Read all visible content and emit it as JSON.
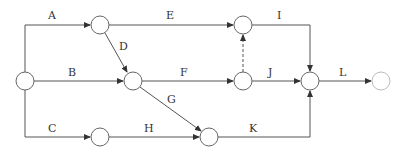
{
  "diagram": {
    "type": "activity-on-arrow network",
    "nodes": [
      {
        "id": "n1",
        "x": 25,
        "y": 81
      },
      {
        "id": "n2",
        "x": 100,
        "y": 25
      },
      {
        "id": "n3",
        "x": 133,
        "y": 81
      },
      {
        "id": "n4",
        "x": 100,
        "y": 137
      },
      {
        "id": "n5",
        "x": 209,
        "y": 137
      },
      {
        "id": "n6",
        "x": 243,
        "y": 25
      },
      {
        "id": "n7",
        "x": 243,
        "y": 81
      },
      {
        "id": "n8",
        "x": 310,
        "y": 81
      },
      {
        "id": "n9",
        "x": 381,
        "y": 81
      }
    ],
    "activities": [
      {
        "label": "A",
        "from": "n1",
        "to": "n2"
      },
      {
        "label": "B",
        "from": "n1",
        "to": "n3"
      },
      {
        "label": "C",
        "from": "n1",
        "to": "n4"
      },
      {
        "label": "D",
        "from": "n2",
        "to": "n3"
      },
      {
        "label": "E",
        "from": "n2",
        "to": "n6"
      },
      {
        "label": "F",
        "from": "n3",
        "to": "n7"
      },
      {
        "label": "G",
        "from": "n3",
        "to": "n5"
      },
      {
        "label": "H",
        "from": "n4",
        "to": "n5"
      },
      {
        "label": "I",
        "from": "n6",
        "to": "n8"
      },
      {
        "label": "J",
        "from": "n7",
        "to": "n8"
      },
      {
        "label": "K",
        "from": "n5",
        "to": "n8"
      },
      {
        "label": "L",
        "from": "n8",
        "to": "n9"
      }
    ],
    "dummy": [
      {
        "from": "n7",
        "to": "n6",
        "style": "dashed"
      }
    ],
    "labels": {
      "A": "A",
      "B": "B",
      "C": "C",
      "D": "D",
      "E": "E",
      "F": "F",
      "G": "G",
      "H": "H",
      "I": "I",
      "J": "J",
      "K": "K",
      "L": "L"
    }
  }
}
